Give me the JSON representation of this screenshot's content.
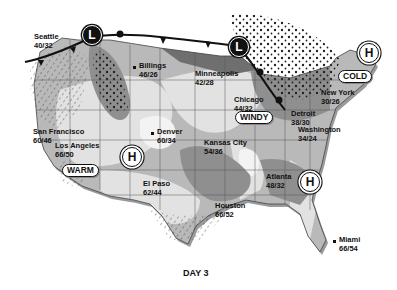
{
  "map": {
    "caption": "DAY 3",
    "colors": {
      "land_light": "#e2e2e2",
      "land_mid": "#b9b9b9",
      "land_dark": "#8f8f8f",
      "land_darkest": "#6f6f6f",
      "warm_pocket": "#f3f3f3",
      "front_line": "#111111",
      "coast_shadow": "#9a9a9a"
    },
    "pressure_systems": [
      {
        "type": "low",
        "label": "L",
        "location": "Pacific Northwest"
      },
      {
        "type": "low",
        "label": "L",
        "location": "Upper Great Lakes"
      },
      {
        "type": "high",
        "label": "H",
        "location": "Northern New England"
      },
      {
        "type": "high",
        "label": "H",
        "location": "Southwest"
      },
      {
        "type": "high",
        "label": "H",
        "location": "Southeast"
      }
    ],
    "condition_tags": [
      {
        "label": "COLD"
      },
      {
        "label": "WINDY"
      },
      {
        "label": "WARM"
      }
    ],
    "cities": [
      {
        "name": "Seattle",
        "temps": "40/32"
      },
      {
        "name": "Billings",
        "temps": "46/26"
      },
      {
        "name": "Minneapolis",
        "temps": "42/28"
      },
      {
        "name": "Chicago",
        "temps": "44/32"
      },
      {
        "name": "Detroit",
        "temps": "38/30"
      },
      {
        "name": "New York",
        "temps": "30/26"
      },
      {
        "name": "Washington",
        "temps": "34/24"
      },
      {
        "name": "San Francisco",
        "temps": "60/46"
      },
      {
        "name": "Los Angeles",
        "temps": "66/50"
      },
      {
        "name": "Denver",
        "temps": "60/34"
      },
      {
        "name": "Kansas City",
        "temps": "54/36"
      },
      {
        "name": "El Paso",
        "temps": "62/44"
      },
      {
        "name": "Houston",
        "temps": "66/52"
      },
      {
        "name": "Atlanta",
        "temps": "48/32"
      },
      {
        "name": "Miami",
        "temps": "66/54"
      }
    ]
  }
}
